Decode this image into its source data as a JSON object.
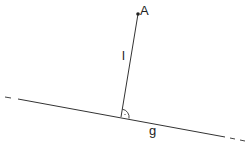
{
  "diagram": {
    "type": "geometry",
    "point": {
      "label": "A"
    },
    "segment": {
      "label": "l"
    },
    "line": {
      "label": "g"
    },
    "right_angle_marker": true,
    "colors": {
      "stroke": "#333333",
      "background": "#ffffff"
    }
  }
}
